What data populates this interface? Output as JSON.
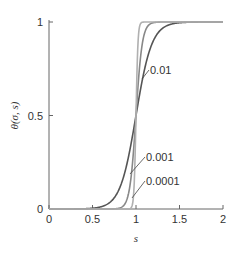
{
  "chart_data": {
    "type": "line",
    "title": "",
    "xlabel": "s",
    "ylabel": "θ(σ, s)",
    "xlim": [
      0,
      2
    ],
    "ylim": [
      0,
      1
    ],
    "xticks": [
      "0",
      "0.5",
      "1",
      "1.5",
      "2"
    ],
    "yticks": [
      "0",
      "0.5",
      "1"
    ],
    "grid": false,
    "legend": "none (inline annotations)",
    "series": [
      {
        "name": "0.01",
        "color": "#555555",
        "sigma": 0.01
      },
      {
        "name": "0.001",
        "color": "#888888",
        "sigma": 0.001
      },
      {
        "name": "0.0001",
        "color": "#b0b0b0",
        "sigma": 0.0001
      }
    ],
    "annotations": [
      {
        "text": "0.01",
        "x": 1.2,
        "y": 0.78
      },
      {
        "text": "0.001",
        "x": 1.15,
        "y": 0.28
      },
      {
        "text": "0.0001",
        "x": 1.15,
        "y": 0.18
      }
    ]
  }
}
